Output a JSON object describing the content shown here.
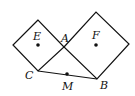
{
  "diagram": {
    "labels": {
      "E": "E",
      "A": "A",
      "F": "F",
      "C": "C",
      "M": "M",
      "B": "B"
    },
    "stroke_color": "#111111",
    "point_color": "#111111"
  }
}
